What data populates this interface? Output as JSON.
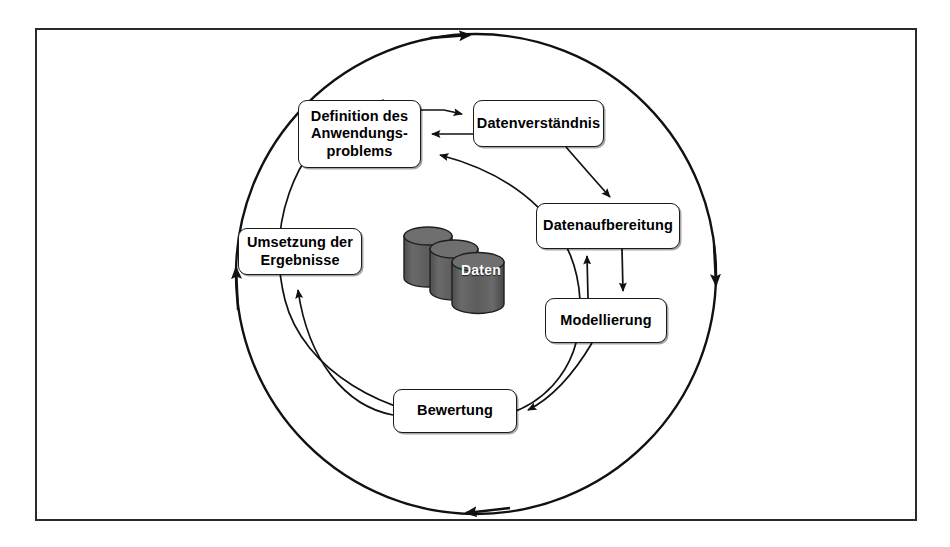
{
  "diagram": {
    "frame": {
      "border_color": "#2b2b2b",
      "background": "#ffffff"
    },
    "nodes": [
      {
        "id": "definition",
        "label": "Definition des\nAnwendungs-\nproblems"
      },
      {
        "id": "datenverstaendnis",
        "label": "Datenverständnis"
      },
      {
        "id": "datenaufbereitung",
        "label": "Datenaufbereitung"
      },
      {
        "id": "modellierung",
        "label": "Modellierung"
      },
      {
        "id": "bewertung",
        "label": "Bewertung"
      },
      {
        "id": "umsetzung",
        "label": "Umsetzung der\nErgebnisse"
      }
    ],
    "datastore": {
      "label": "Daten",
      "cylinder_count": 3,
      "fill_color": "#5a5a5a",
      "top_color": "#6e6e6e",
      "label_color": "#ffffff"
    },
    "rings": [
      {
        "id": "outer-ring",
        "direction": "clockwise",
        "arrow_positions": [
          "top",
          "right",
          "bottom",
          "left"
        ]
      },
      {
        "id": "inner-ring",
        "direction": "counterclockwise",
        "arrow_positions": [
          "top-right"
        ]
      }
    ],
    "connectors": [
      {
        "from": "definition",
        "to": "datenverstaendnis",
        "style": "straight-arrow"
      },
      {
        "from": "datenverstaendnis",
        "to": "definition",
        "style": "straight-arrow"
      },
      {
        "from": "datenverstaendnis",
        "to": "datenaufbereitung",
        "style": "curved-arrow"
      },
      {
        "from": "datenaufbereitung",
        "to": "modellierung",
        "style": "straight-arrow"
      },
      {
        "from": "modellierung",
        "to": "datenaufbereitung",
        "style": "straight-arrow"
      },
      {
        "from": "modellierung",
        "to": "bewertung",
        "style": "curved-arrow"
      },
      {
        "from": "bewertung",
        "to": "umsetzung",
        "style": "curved-arrow"
      },
      {
        "from": "bewertung",
        "to": "definition",
        "style": "curved-arrow-inner-ring"
      }
    ],
    "colors": {
      "stroke": "#1a1a1a",
      "node_fill": "#ffffff",
      "text": "#000000"
    }
  }
}
